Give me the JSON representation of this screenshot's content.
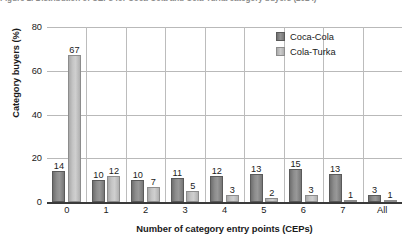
{
  "caption": {
    "text": "Figure 1. Distribution of CEPs for Coca-Cola and Cola-Turka category buyers (2024)"
  },
  "chart_data": {
    "type": "bar",
    "title": "",
    "xlabel": "Number of category entry points (CEPs)",
    "ylabel": "Category buyers (%)",
    "categories": [
      "0",
      "1",
      "2",
      "3",
      "4",
      "5",
      "6",
      "7",
      "All"
    ],
    "series": [
      {
        "name": "Coca-Cola",
        "color": "#8e8e8e",
        "values": [
          14,
          10,
          10,
          11,
          12,
          13,
          15,
          13,
          3
        ]
      },
      {
        "name": "Cola-Turka",
        "color": "#c6c6c6",
        "values": [
          67,
          12,
          7,
          5,
          3,
          2,
          3,
          1,
          1
        ]
      }
    ],
    "ylim": [
      0,
      80
    ],
    "yticks": [
      0,
      20,
      40,
      60,
      80
    ],
    "grid": true,
    "legend_position": "top-right"
  }
}
